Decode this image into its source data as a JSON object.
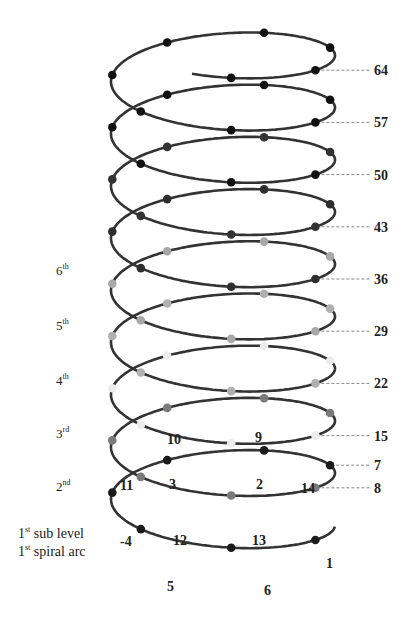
{
  "diagram": {
    "geometry": {
      "cx": 223,
      "rx": 112,
      "ry": 35,
      "step": 52.2,
      "first_cross_y": 540
    },
    "line_color": "#333333",
    "level_colors": [
      "#1a1a1a",
      "#7a7a7a",
      "#ececec",
      "#b0b0b0",
      "#a8a8a8",
      "#2e2e2e",
      "#333333",
      "#111111",
      "#111111",
      "#111111"
    ],
    "right_labels": [
      "64",
      "57",
      "50",
      "43",
      "36",
      "29",
      "22",
      "15",
      "8",
      "7"
    ],
    "inner_labels": [
      {
        "text": "1",
        "x": 326,
        "y": 568
      },
      {
        "text": "2",
        "x": 256,
        "y": 489
      },
      {
        "text": "3",
        "x": 169,
        "y": 489
      },
      {
        "text": "-4",
        "x": 120,
        "y": 546
      },
      {
        "text": "5",
        "x": 167,
        "y": 591
      },
      {
        "text": "6",
        "x": 264,
        "y": 595
      },
      {
        "text": "9",
        "x": 255,
        "y": 442
      },
      {
        "text": "10",
        "x": 167,
        "y": 444
      },
      {
        "text": "11",
        "x": 120,
        "y": 490
      },
      {
        "text": "12",
        "x": 173,
        "y": 545
      },
      {
        "text": "13",
        "x": 252,
        "y": 545
      },
      {
        "text": "14",
        "x": 301,
        "y": 493
      }
    ]
  },
  "levels": [
    {
      "id": "l6",
      "num": "6",
      "sup": "th",
      "y": 262
    },
    {
      "id": "l5",
      "num": "5",
      "sup": "th",
      "y": 317
    },
    {
      "id": "l4",
      "num": "4",
      "sup": "th",
      "y": 372
    },
    {
      "id": "l3",
      "num": "3",
      "sup": "rd",
      "y": 425
    },
    {
      "id": "l2",
      "num": "2",
      "sup": "nd",
      "y": 478
    }
  ],
  "bottom_labels": {
    "line1_num": "1",
    "line1_sup": "st",
    "line1_text": " sub level",
    "line2_num": "1",
    "line2_sup": "st",
    "line2_text": " spiral arc"
  }
}
